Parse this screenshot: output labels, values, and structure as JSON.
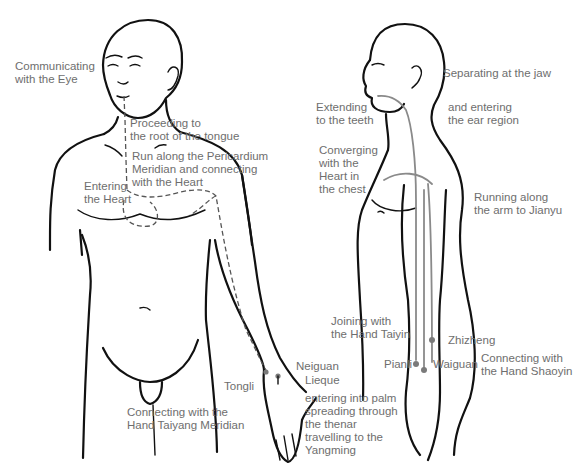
{
  "figure": {
    "front_view": {
      "labels": {
        "eye": "Communicating\nwith the Eye",
        "tongue": "Proceeding to\nthe root of the tongue",
        "pericardium": "Run along the Pericardium\nMeridian and connecting\nwith the Heart",
        "heart": "Entering\nthe Heart",
        "neiguan": "Neiguan",
        "tongli": "Tongli",
        "lieque": "Lieque",
        "palm": "entering into palm\nspreading through\nthe thenar\ntravelling to the\nYangming",
        "taiyang": "Connecting with the\nHand Taiyang Meridian"
      }
    },
    "side_view": {
      "labels": {
        "jaw": "Separating at the jaw",
        "ear": "and entering\nthe ear region",
        "teeth": "Extending\nto the teeth",
        "chest": "Converging\nwith the\nHeart in\nthe chest",
        "jianyu": "Running along\nthe arm to Jianyu",
        "taiyin": "Joining with\nthe Hand Taiyin",
        "zhizheng": "Zhizheng",
        "pianli": "Pianli",
        "waiguan": "Waiguan",
        "shaoyin": "Connecting with\nthe Hand Shaoyin"
      }
    },
    "colors": {
      "outline": "#111111",
      "meridian": "#8a8a8a",
      "label": "#6e6e6e"
    }
  }
}
